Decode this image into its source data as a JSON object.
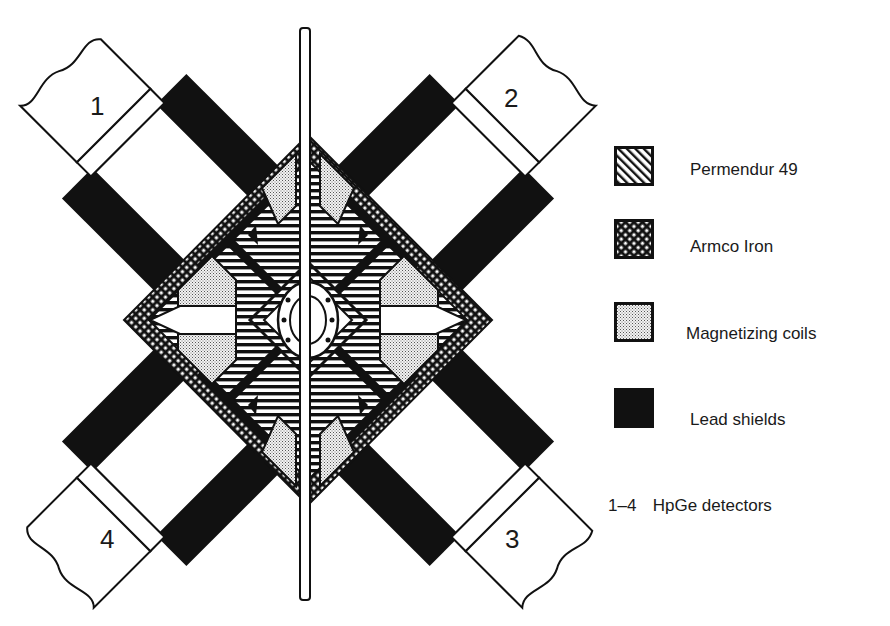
{
  "figure": {
    "detectors": [
      {
        "label": "1",
        "position": "upper-left"
      },
      {
        "label": "2",
        "position": "upper-right"
      },
      {
        "label": "3",
        "position": "lower-right"
      },
      {
        "label": "4",
        "position": "lower-left"
      }
    ],
    "colors": {
      "ink": "#111111",
      "paper": "#ffffff"
    }
  },
  "legend": {
    "items": [
      {
        "label": "Permendur 49",
        "pattern": "diagonal-hatch"
      },
      {
        "label": "Armco Iron",
        "pattern": "cross-hatch"
      },
      {
        "label": "Magnetizing coils",
        "pattern": "stipple"
      },
      {
        "label": "Lead shields",
        "pattern": "solid-black"
      }
    ],
    "detector_note": {
      "range": "1–4",
      "label": "HpGe detectors"
    }
  }
}
